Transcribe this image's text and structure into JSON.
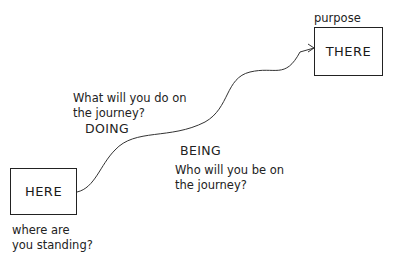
{
  "diagram": {
    "start": {
      "label": "HERE",
      "caption_line1": "where are",
      "caption_line2": "you standing?"
    },
    "end": {
      "label": "THERE",
      "caption": "purpose"
    },
    "doing": {
      "question_line1": "What will you do on",
      "question_line2": "the journey?",
      "heading": "DOING"
    },
    "being": {
      "heading": "BEING",
      "question_line1": "Who will you be on",
      "question_line2": "the journey?"
    },
    "path": {
      "type": "curved-arrow",
      "from": "HERE",
      "to": "THERE"
    },
    "colors": {
      "stroke": "#222222",
      "background": "#ffffff"
    }
  }
}
